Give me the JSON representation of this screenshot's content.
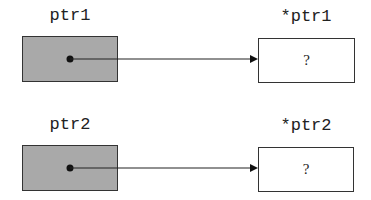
{
  "pointers": [
    {
      "name": "ptr1",
      "target_label": "*ptr1",
      "target_value": "?"
    },
    {
      "name": "ptr2",
      "target_label": "*ptr2",
      "target_value": "?"
    }
  ],
  "colors": {
    "pointer_box": "#a9a9a9",
    "target_box": "#ffffff",
    "stroke": "#222222"
  }
}
